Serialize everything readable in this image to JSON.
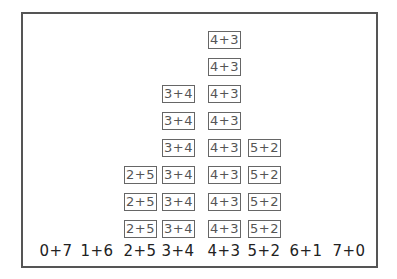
{
  "chart_data": {
    "type": "bar",
    "title": "",
    "xlabel": "",
    "ylabel": "",
    "categories": [
      "0+7",
      "1+6",
      "2+5",
      "3+4",
      "4+3",
      "5+2",
      "6+1",
      "7+0"
    ],
    "values": [
      0,
      0,
      3,
      6,
      8,
      4,
      0,
      0
    ],
    "style": "pictograph stacked boxes labeled with the category",
    "grid": false,
    "legend": null
  },
  "columns": [
    {
      "label": "0+7",
      "count": 0,
      "center_x": 56
    },
    {
      "label": "1+6",
      "count": 0,
      "center_x": 97
    },
    {
      "label": "2+5",
      "count": 3,
      "center_x": 140
    },
    {
      "label": "3+4",
      "count": 6,
      "center_x": 178
    },
    {
      "label": "4+3",
      "count": 8,
      "center_x": 224
    },
    {
      "label": "5+2",
      "count": 4,
      "center_x": 264
    },
    {
      "label": "6+1",
      "count": 0,
      "center_x": 306
    },
    {
      "label": "7+0",
      "count": 0,
      "center_x": 349
    }
  ],
  "colors": {
    "frame": "#555555",
    "box_border": "#666666",
    "box_text": "#555555",
    "label_text": "#222222"
  }
}
